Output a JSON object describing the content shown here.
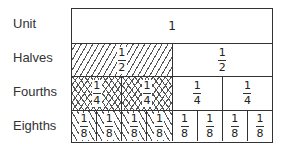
{
  "labels": {
    "unit": "Unit",
    "halves": "Halves",
    "fourths": "Fourths",
    "eighths": "Eighths"
  },
  "rows": {
    "unit": {
      "value": "1"
    },
    "halves": [
      {
        "num": "1",
        "den": "2",
        "shaded": true
      },
      {
        "num": "1",
        "den": "2",
        "shaded": false
      }
    ],
    "fourths": [
      {
        "num": "1",
        "den": "4",
        "shaded": true
      },
      {
        "num": "1",
        "den": "4",
        "shaded": true
      },
      {
        "num": "1",
        "den": "4",
        "shaded": false
      },
      {
        "num": "1",
        "den": "4",
        "shaded": false
      }
    ],
    "eighths": [
      {
        "num": "1",
        "den": "8",
        "shaded": true
      },
      {
        "num": "1",
        "den": "8",
        "shaded": true
      },
      {
        "num": "1",
        "den": "8",
        "shaded": true
      },
      {
        "num": "1",
        "den": "8",
        "shaded": true
      },
      {
        "num": "1",
        "den": "8",
        "shaded": false
      },
      {
        "num": "1",
        "den": "8",
        "shaded": false
      },
      {
        "num": "1",
        "den": "8",
        "shaded": false
      },
      {
        "num": "1",
        "den": "8",
        "shaded": false
      }
    ]
  }
}
